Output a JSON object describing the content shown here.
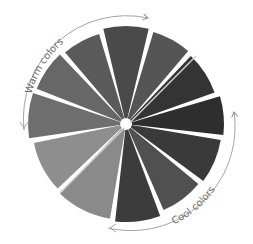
{
  "diagram": {
    "type": "color-wheel",
    "center": [
      126,
      124
    ],
    "radius": 98,
    "segment_count": 12,
    "segments": [
      {
        "name": "segment-1",
        "start_deg": -105,
        "end_deg": -75,
        "fill": "#4a4a4a"
      },
      {
        "name": "segment-2",
        "start_deg": -75,
        "end_deg": -48,
        "fill": "#555555"
      },
      {
        "name": "segment-3",
        "start_deg": -48,
        "end_deg": -18,
        "fill": "#343434"
      },
      {
        "name": "segment-4",
        "start_deg": -18,
        "end_deg": 8,
        "fill": "#2e2e2e"
      },
      {
        "name": "segment-5",
        "start_deg": 8,
        "end_deg": 38,
        "fill": "#3a3a3a"
      },
      {
        "name": "segment-6",
        "start_deg": 38,
        "end_deg": 68,
        "fill": "#505050"
      },
      {
        "name": "segment-7",
        "start_deg": 68,
        "end_deg": 98,
        "fill": "#3c3c3c"
      },
      {
        "name": "segment-8",
        "start_deg": 98,
        "end_deg": 135,
        "fill": "#8a8a8a"
      },
      {
        "name": "segment-9",
        "start_deg": 135,
        "end_deg": 170,
        "fill": "#8e8e8e"
      },
      {
        "name": "segment-10",
        "start_deg": 170,
        "end_deg": 200,
        "fill": "#6e6e6e"
      },
      {
        "name": "segment-11",
        "start_deg": 200,
        "end_deg": 228,
        "fill": "#676767"
      },
      {
        "name": "segment-12",
        "start_deg": 228,
        "end_deg": 255,
        "fill": "#5a5a5a"
      }
    ],
    "divider": {
      "from": [
        60,
        193
      ],
      "to": [
        196,
        56
      ],
      "color": "#cfcfcf"
    },
    "labels": {
      "warm": "Warm colors",
      "cool": "Cool colors"
    },
    "arrow_color": "#8a8a8a"
  }
}
